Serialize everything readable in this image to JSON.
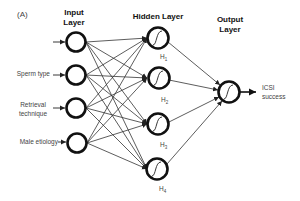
{
  "panel_label": "(A)",
  "layers": {
    "input": {
      "title_line1": "Input",
      "title_line2": "Layer"
    },
    "hidden": {
      "title": "Hidden Layer"
    },
    "output": {
      "title_line1": "Output",
      "title_line2": "Layer"
    }
  },
  "inputs": [
    {
      "label": ""
    },
    {
      "label": "Sperm type"
    },
    {
      "label_line1": "Retrieval",
      "label_line2": "technique"
    },
    {
      "label": "Male etiology"
    }
  ],
  "hidden_nodes": [
    {
      "label": "H",
      "sub": "1"
    },
    {
      "label": "H",
      "sub": "2"
    },
    {
      "label": "H",
      "sub": "3"
    },
    {
      "label": "H",
      "sub": "4"
    }
  ],
  "output": {
    "label_line1": "ICSI",
    "label_line2": "success"
  },
  "colors": {
    "stroke": "#111111",
    "line": "#333333",
    "text": "#444444"
  }
}
